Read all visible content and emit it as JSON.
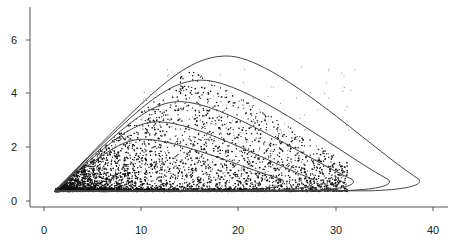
{
  "chart_data": {
    "type": "scatter",
    "title": "",
    "xlabel": "",
    "ylabel": "",
    "xlim": [
      -3,
      41
    ],
    "ylim": [
      -0.2,
      7
    ],
    "grid": false,
    "legend": null,
    "x_ticks": [
      0,
      10,
      20,
      30,
      40
    ],
    "y_ticks": [
      0,
      2,
      4,
      6
    ],
    "x_tick_labels": [
      "0",
      "10",
      "20",
      "30",
      "40"
    ],
    "y_tick_labels": [
      "0",
      "2",
      "4",
      "6"
    ],
    "scatter_description": "Dense cloud of several thousand small points, densest near x=2-12, y=0.4-1.5, thinning toward upper right; bounded below at y≈0.35, starting at x≈1.",
    "scatter_region": {
      "x_min": 1.1,
      "y_min": 0.35,
      "dense_x": [
        2,
        14
      ],
      "dense_y": [
        0.4,
        1.8
      ],
      "n_points": 4500
    },
    "envelopes": [
      {
        "name": "curve-1",
        "start": [
          1.1,
          0.37
        ],
        "peak": [
          10.2,
          2.3
        ],
        "tip": [
          24.5,
          0.8
        ]
      },
      {
        "name": "curve-2",
        "start": [
          1.1,
          0.37
        ],
        "peak": [
          11.7,
          2.95
        ],
        "tip": [
          27.7,
          0.8
        ]
      },
      {
        "name": "curve-3",
        "start": [
          1.1,
          0.37
        ],
        "peak": [
          14.0,
          3.7
        ],
        "tip": [
          31.7,
          0.8
        ]
      },
      {
        "name": "curve-4",
        "start": [
          1.1,
          0.37
        ],
        "peak": [
          16.2,
          4.5
        ],
        "tip": [
          35.4,
          0.8
        ]
      },
      {
        "name": "curve-5",
        "start": [
          1.1,
          0.37
        ],
        "peak": [
          18.8,
          5.4
        ],
        "tip": [
          38.5,
          0.82
        ]
      }
    ]
  },
  "axes": {
    "x_labels": [
      "0",
      "10",
      "20",
      "30",
      "40"
    ],
    "y_labels": [
      "0",
      "2",
      "4",
      "6"
    ]
  }
}
